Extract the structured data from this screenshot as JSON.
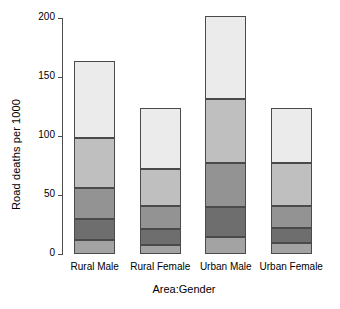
{
  "chart_data": {
    "type": "bar",
    "subtype": "stacked",
    "title": "",
    "xlabel": "Area:Gender",
    "ylabel": "Road deaths per 1000",
    "categories": [
      "Rural Male",
      "Rural Female",
      "Urban Male",
      "Urban Female"
    ],
    "ylim": [
      0,
      200
    ],
    "yticks": [
      0,
      50,
      100,
      150,
      200
    ],
    "ytick_labels": [
      "0",
      "50",
      "100",
      "150",
      "200"
    ],
    "grid": false,
    "legend": "none",
    "series": [
      {
        "name": "segment-1",
        "color": "#a3a3a3",
        "values": [
          12,
          8,
          14,
          9
        ]
      },
      {
        "name": "segment-2",
        "color": "#6e6e6e",
        "values": [
          18,
          13,
          26,
          13
        ]
      },
      {
        "name": "segment-3",
        "color": "#939393",
        "values": [
          26,
          20,
          37,
          19
        ]
      },
      {
        "name": "segment-4",
        "color": "#bfbfbf",
        "values": [
          42,
          31,
          54,
          36
        ]
      },
      {
        "name": "segment-5",
        "color": "#ebebeb",
        "values": [
          66,
          52,
          71,
          47
        ]
      }
    ],
    "totals": [
      164,
      124,
      202,
      124
    ]
  },
  "axis": {
    "y_title": "Road deaths per 1000",
    "x_title": "Area:Gender",
    "tick_0": "0",
    "tick_50": "50",
    "tick_100": "100",
    "tick_150": "150",
    "tick_200": "200"
  },
  "colors": {
    "axis": "#4d4d4d",
    "bar_border": "#4a4a4a",
    "background": "#ffffff",
    "text": "#000000"
  }
}
